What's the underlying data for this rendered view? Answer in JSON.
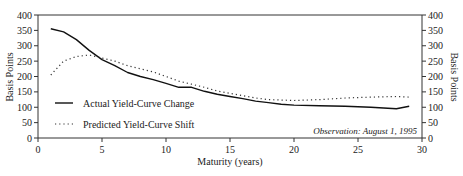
{
  "chart_data": {
    "type": "line",
    "title": "",
    "xlabel": "Maturity (years)",
    "ylabel": "Basis Points",
    "ylabel_right": "Basis Points",
    "xlim": [
      0,
      30
    ],
    "ylim": [
      0,
      400
    ],
    "xticks": [
      0,
      5,
      10,
      15,
      20,
      25,
      30
    ],
    "yticks": [
      0,
      50,
      100,
      150,
      200,
      250,
      300,
      350,
      400
    ],
    "grid": false,
    "legend_position": "lower-left",
    "annotation": "Observation:  August 1, 1995",
    "series": [
      {
        "name": "Actual Yield-Curve Change",
        "style": "solid",
        "x": [
          1,
          2,
          3,
          4,
          5,
          6,
          7,
          8,
          9,
          10,
          11,
          12,
          13,
          14,
          15,
          16,
          17,
          18,
          19,
          20,
          22,
          24,
          26,
          28,
          29
        ],
        "values": [
          355,
          345,
          320,
          285,
          255,
          235,
          213,
          200,
          190,
          178,
          165,
          165,
          152,
          142,
          135,
          128,
          120,
          115,
          110,
          107,
          105,
          103,
          100,
          95,
          103
        ]
      },
      {
        "name": "Predicted Yield-Curve Shift",
        "style": "dotted",
        "x": [
          1,
          2,
          3,
          4,
          5,
          6,
          7,
          8,
          9,
          10,
          11,
          12,
          13,
          14,
          15,
          16,
          17,
          18,
          20,
          22,
          24,
          26,
          28,
          29
        ],
        "values": [
          205,
          250,
          265,
          270,
          260,
          250,
          235,
          225,
          215,
          200,
          185,
          175,
          165,
          153,
          145,
          138,
          130,
          125,
          122,
          125,
          130,
          133,
          135,
          133
        ]
      }
    ]
  }
}
